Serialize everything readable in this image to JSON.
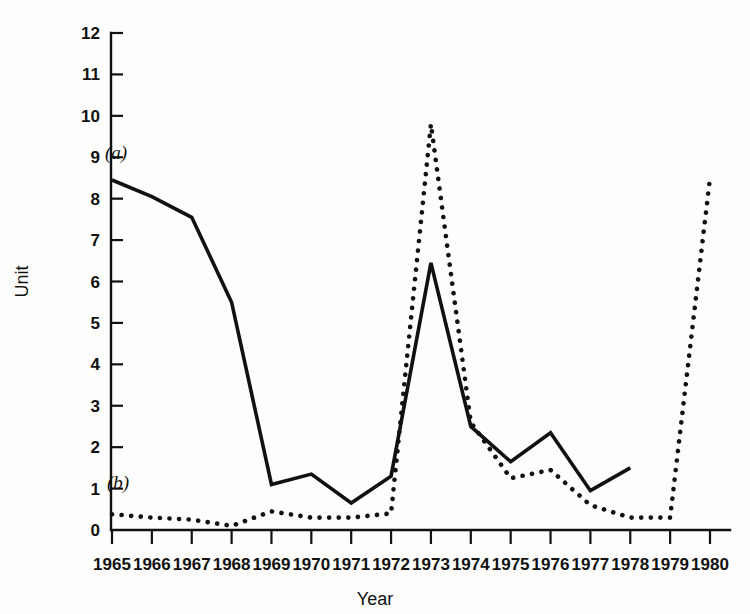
{
  "chart_data": {
    "type": "line",
    "title": "",
    "xlabel": "Year",
    "ylabel": "Unit",
    "categories": [
      1965,
      1966,
      1967,
      1968,
      1969,
      1970,
      1971,
      1972,
      1973,
      1974,
      1975,
      1976,
      1977,
      1978,
      1979,
      1980
    ],
    "xtick_labels": [
      "1965",
      "1966",
      "1967",
      "1968",
      "1969",
      "1970",
      "1971",
      "1972",
      "1973",
      "1974",
      "1975",
      "1976",
      "1977",
      "1978",
      "1979",
      "1980"
    ],
    "ytick_labels": [
      "0",
      "1",
      "2",
      "3",
      "4",
      "5",
      "6",
      "7",
      "8",
      "9",
      "10",
      "11",
      "12"
    ],
    "ytick_values": [
      0,
      1,
      2,
      3,
      4,
      5,
      6,
      7,
      8,
      9,
      10,
      11,
      12
    ],
    "xlim": [
      1965,
      1980
    ],
    "ylim": [
      0,
      12
    ],
    "grid": false,
    "legend_position": "inline-annotation",
    "series": [
      {
        "name": "(a)",
        "style": "solid",
        "color": "#111111",
        "x": [
          1965,
          1966,
          1967,
          1968,
          1969,
          1970,
          1971,
          1972,
          1973,
          1974,
          1975,
          1976,
          1977,
          1978
        ],
        "values": [
          8.45,
          8.05,
          7.55,
          5.5,
          1.1,
          1.35,
          0.65,
          1.3,
          6.45,
          2.5,
          1.65,
          2.35,
          0.95,
          1.5
        ],
        "annotation": "(a)",
        "annotation_x": 1965.1,
        "annotation_y": 8.95
      },
      {
        "name": "(b)",
        "style": "dotted",
        "color": "#111111",
        "x": [
          1965,
          1966,
          1967,
          1968,
          1969,
          1970,
          1971,
          1972,
          1973,
          1974,
          1975,
          1976,
          1977,
          1978,
          1979,
          1980
        ],
        "values": [
          0.38,
          0.3,
          0.25,
          0.1,
          0.45,
          0.3,
          0.3,
          0.4,
          9.8,
          2.6,
          1.25,
          1.45,
          0.6,
          0.3,
          0.3,
          8.5
        ],
        "annotation": "(b)",
        "annotation_x": 1965.15,
        "annotation_y": 1.0
      }
    ],
    "annotations": [
      {
        "text": "(a)",
        "x": 1965.1,
        "y": 8.95
      },
      {
        "text": "(b)",
        "x": 1965.15,
        "y": 1.0
      }
    ]
  },
  "colors": {
    "foreground": "#111111",
    "background": "#fdfdfc"
  }
}
